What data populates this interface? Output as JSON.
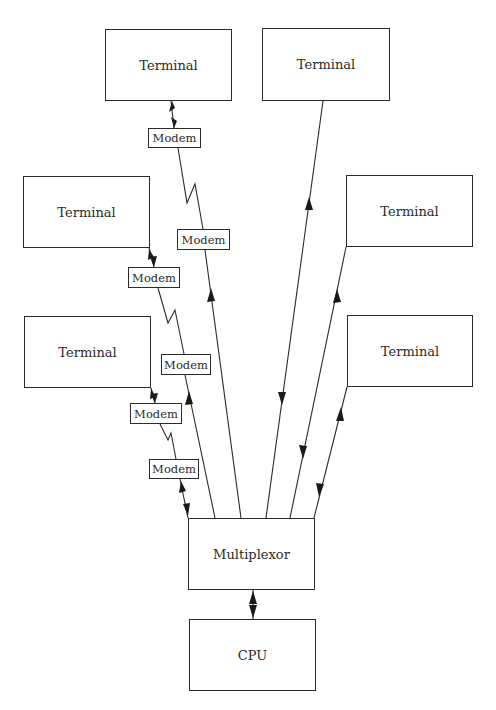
{
  "diagram": {
    "type": "network",
    "terminals": [
      {
        "id": "t1",
        "label": "Terminal",
        "x": 105,
        "y": 29,
        "w": 127,
        "h": 72
      },
      {
        "id": "t2",
        "label": "Terminal",
        "x": 262,
        "y": 28,
        "w": 128,
        "h": 73
      },
      {
        "id": "t3",
        "label": "Terminal",
        "x": 23,
        "y": 176,
        "w": 127,
        "h": 72
      },
      {
        "id": "t4",
        "label": "Terminal",
        "x": 346,
        "y": 175,
        "w": 127,
        "h": 72
      },
      {
        "id": "t5",
        "label": "Terminal",
        "x": 24,
        "y": 316,
        "w": 127,
        "h": 72
      },
      {
        "id": "t6",
        "label": "Terminal",
        "x": 347,
        "y": 315,
        "w": 126,
        "h": 72
      }
    ],
    "modems": [
      {
        "id": "m1",
        "label": "Modem",
        "x": 148,
        "y": 128,
        "w": 53,
        "h": 20
      },
      {
        "id": "m2",
        "label": "Modem",
        "x": 177,
        "y": 229,
        "w": 53,
        "h": 21
      },
      {
        "id": "m3",
        "label": "Modem",
        "x": 128,
        "y": 267,
        "w": 52,
        "h": 21
      },
      {
        "id": "m4",
        "label": "Modem",
        "x": 161,
        "y": 354,
        "w": 50,
        "h": 21
      },
      {
        "id": "m5",
        "label": "Modem",
        "x": 130,
        "y": 403,
        "w": 52,
        "h": 21
      },
      {
        "id": "m6",
        "label": "Modem",
        "x": 149,
        "y": 459,
        "w": 50,
        "h": 20
      }
    ],
    "multiplexor": {
      "label": "Multiplexor",
      "x": 188,
      "y": 518,
      "w": 127,
      "h": 72
    },
    "cpu": {
      "label": "CPU",
      "x": 189,
      "y": 619,
      "w": 127,
      "h": 72
    },
    "connections": [
      "Terminal t1 <-> Modem m1 ~ phone line ~ Modem m2 -> Multiplexor",
      "Terminal t3 <-> Modem m3 ~ phone line ~ Modem m4 -> Multiplexor",
      "Terminal t5 <-> Modem m5 ~ phone line ~ Modem m6 <-> Multiplexor",
      "Terminal t2 <-> Multiplexor (direct line)",
      "Terminal t4 <-> Multiplexor (direct line)",
      "Terminal t6 <-> Multiplexor (direct line)",
      "Multiplexor <-> CPU"
    ]
  }
}
